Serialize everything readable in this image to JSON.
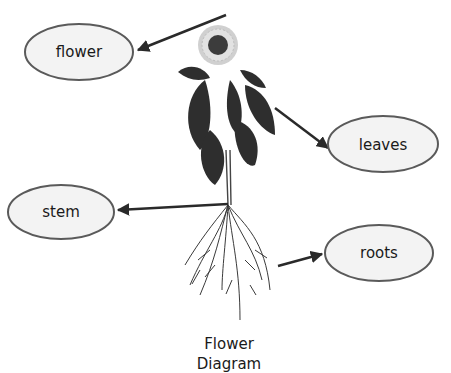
{
  "diagram": {
    "title_line1": "Flower",
    "title_line2": "Diagram",
    "labels": {
      "flower": "flower",
      "leaves": "leaves",
      "stem": "stem",
      "roots": "roots"
    }
  },
  "colors": {
    "ink": "#1a1a1a",
    "ellipse_stroke": "#5a5a5a",
    "ellipse_fill": "#f3f3f3",
    "arrow": "#2a2a2a",
    "leaf": "#2e2e2e",
    "petal": "#cfcfcf"
  }
}
